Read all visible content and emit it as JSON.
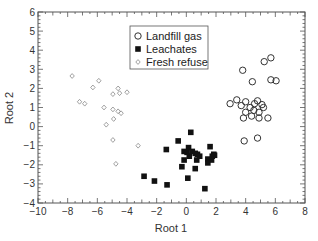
{
  "chart_data": {
    "type": "scatter",
    "title": "",
    "xlabel": "Root 1",
    "ylabel": "Root 2",
    "xlim": [
      -10,
      8
    ],
    "ylim": [
      -4,
      6
    ],
    "xticks": [
      -10,
      -8,
      -6,
      -4,
      -2,
      0,
      2,
      4,
      6,
      8
    ],
    "yticks": [
      -4,
      -3,
      -2,
      -1,
      0,
      1,
      2,
      3,
      4,
      5,
      6
    ],
    "grid": false,
    "legend_position": "upper center",
    "series": [
      {
        "name": "Landfill gas",
        "marker": "open-circle",
        "color": "#333333",
        "points": [
          [
            3.8,
            2.95
          ],
          [
            5.25,
            3.4
          ],
          [
            5.7,
            3.6
          ],
          [
            4.45,
            2.35
          ],
          [
            5.7,
            2.45
          ],
          [
            6.05,
            2.4
          ],
          [
            2.95,
            1.2
          ],
          [
            3.4,
            1.4
          ],
          [
            4.0,
            1.3
          ],
          [
            4.8,
            1.35
          ],
          [
            3.7,
            1.1
          ],
          [
            4.3,
            1.0
          ],
          [
            5.2,
            1.0
          ],
          [
            4.0,
            0.75
          ],
          [
            4.55,
            0.85
          ],
          [
            4.9,
            0.75
          ],
          [
            3.85,
            0.45
          ],
          [
            4.4,
            0.55
          ],
          [
            4.9,
            0.45
          ],
          [
            5.5,
            0.45
          ],
          [
            3.9,
            -0.75
          ],
          [
            4.8,
            -0.6
          ],
          [
            4.6,
            1.2
          ],
          [
            5.1,
            1.15
          ]
        ]
      },
      {
        "name": "Leachates",
        "marker": "filled-square",
        "color": "#111111",
        "points": [
          [
            0.3,
            -0.3
          ],
          [
            -0.55,
            -0.75
          ],
          [
            -1.35,
            -1.2
          ],
          [
            -2.85,
            -2.6
          ],
          [
            -2.15,
            -2.85
          ],
          [
            -1.3,
            -3.05
          ],
          [
            0.2,
            -1.55
          ],
          [
            0.15,
            -1.1
          ],
          [
            0.4,
            -1.3
          ],
          [
            0.6,
            -1.4
          ],
          [
            0.75,
            -1.45
          ],
          [
            0.7,
            -1.75
          ],
          [
            0.9,
            -1.55
          ],
          [
            -0.15,
            -1.3
          ],
          [
            0.05,
            -1.35
          ],
          [
            -0.15,
            -1.75
          ],
          [
            -0.3,
            -2.1
          ],
          [
            0.6,
            -2.2
          ],
          [
            1.45,
            -1.7
          ],
          [
            1.7,
            -1.75
          ],
          [
            1.85,
            -1.45
          ],
          [
            1.45,
            -1.9
          ],
          [
            1.75,
            -1.55
          ],
          [
            0.1,
            -2.7
          ],
          [
            1.25,
            -3.25
          ],
          [
            1.6,
            -1.05
          ],
          [
            1.9,
            -1.5
          ]
        ]
      },
      {
        "name": "Fresh refuse",
        "marker": "open-diamond",
        "color": "#888888",
        "points": [
          [
            -7.7,
            2.65
          ],
          [
            -5.9,
            2.4
          ],
          [
            -6.3,
            2.05
          ],
          [
            -7.2,
            1.3
          ],
          [
            -6.85,
            1.2
          ],
          [
            -5.55,
            1.0
          ],
          [
            -4.95,
            0.9
          ],
          [
            -4.6,
            0.8
          ],
          [
            -4.4,
            0.7
          ],
          [
            -4.95,
            1.7
          ],
          [
            -4.5,
            1.75
          ],
          [
            -4.6,
            2.0
          ],
          [
            -4.0,
            1.8
          ],
          [
            -4.9,
            0.4
          ],
          [
            -5.4,
            0.1
          ],
          [
            -4.95,
            -0.7
          ],
          [
            -3.25,
            -1.0
          ],
          [
            -4.75,
            -1.95
          ]
        ]
      }
    ]
  }
}
